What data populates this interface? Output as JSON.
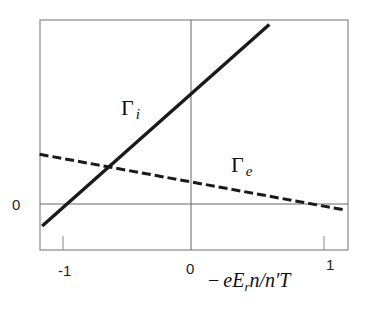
{
  "chart_data": {
    "type": "line",
    "title": "",
    "xlabel": "− eE_r n / n′T",
    "ylabel": "",
    "xlim": [
      -1.18,
      1.2
    ],
    "ylim": [
      -0.5,
      2.0
    ],
    "grid": false,
    "zero_lines": {
      "x": 0,
      "y": 0
    },
    "x_ticks": [
      -1,
      0,
      1
    ],
    "x_tick_labels": [
      "-1",
      "0",
      "1"
    ],
    "y_ticks": [
      0
    ],
    "y_tick_labels": [
      "0"
    ],
    "legend": "none (inline labels)",
    "series": [
      {
        "name": "Γi",
        "label_main": "Γ",
        "label_sub": "i",
        "style": "solid",
        "x": [
          -1.14,
          -1.0,
          0.0,
          0.6
        ],
        "y": [
          -0.24,
          0.0,
          1.22,
          1.95
        ]
      },
      {
        "name": "Γe",
        "label_main": "Γ",
        "label_sub": "e",
        "style": "dashed",
        "x": [
          -1.16,
          0.0,
          0.92,
          1.18
        ],
        "y": [
          0.54,
          0.24,
          0.0,
          -0.065
        ]
      }
    ],
    "annotations": [
      {
        "text": "Γi",
        "x": -0.45,
        "y": 1.0
      },
      {
        "text": "Γe",
        "x": 0.35,
        "y": 0.38
      }
    ]
  },
  "labels": {
    "x_tick_neg1": "-1",
    "x_tick_0": "0",
    "x_tick_1": "1",
    "y_tick_0": "0",
    "gamma_i_main": "Γ",
    "gamma_i_sub": "i",
    "gamma_e_main": "Γ",
    "gamma_e_sub": "e",
    "xaxis_minus": "−",
    "xaxis_e": "eE",
    "xaxis_r": "r",
    "xaxis_rest": "n/n′T"
  },
  "colors": {
    "frame": "#888888",
    "zero_line": "#666666",
    "series_ion": "#1a1a1a",
    "series_electron": "#1a1a1a"
  }
}
